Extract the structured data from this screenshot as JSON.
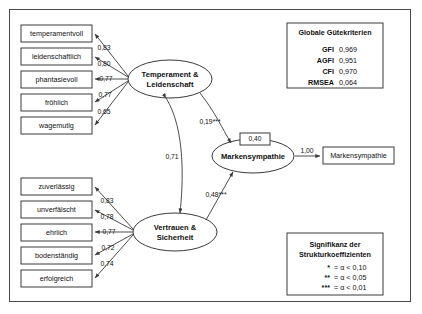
{
  "diagram": {
    "title_visible": false,
    "constructs": [
      {
        "id": "temperament",
        "label_line1": "Temperament &",
        "label_line2": "Leidenschaft"
      },
      {
        "id": "vertrauen",
        "label_line1": "Vertrauen &",
        "label_line2": "Sicherheit"
      },
      {
        "id": "markensympathie",
        "label_line1": "Markensympathie",
        "label_line2": ""
      }
    ],
    "indicators_top": [
      {
        "label": "temperamentvoll",
        "loading": "0,83"
      },
      {
        "label": "leidenschaftlich",
        "loading": "0,80"
      },
      {
        "label": "phantasievoll",
        "loading": "0,77"
      },
      {
        "label": "fröhlich",
        "loading": "0,77"
      },
      {
        "label": "wagemutig",
        "loading": "0,65"
      }
    ],
    "indicators_bottom": [
      {
        "label": "zuverlässig",
        "loading": "0,83"
      },
      {
        "label": "unverfälscht",
        "loading": "0,78"
      },
      {
        "label": "ehrlich",
        "loading": "0,77"
      },
      {
        "label": "bodenständig",
        "loading": "0,72"
      },
      {
        "label": "erfolgreich",
        "loading": "0,74"
      }
    ],
    "outcome_indicator": {
      "label": "Markensympathie",
      "loading": "1,00"
    },
    "structural_paths": [
      {
        "from": "temperament",
        "to": "markensympathie",
        "coefficient": "0,19***"
      },
      {
        "from": "vertrauen",
        "to": "markensympathie",
        "coefficient": "0,48***"
      }
    ],
    "correlation": {
      "between": "temperament-vertrauen",
      "value": "0,71"
    },
    "r_squared": {
      "target": "markensympathie",
      "value": "0,40"
    }
  },
  "fit_box": {
    "title": "Globale Gütekriterien",
    "rows": [
      {
        "key": "GFI",
        "value": "0,969"
      },
      {
        "key": "AGFI",
        "value": "0,951"
      },
      {
        "key": "CFI",
        "value": "0,970"
      },
      {
        "key": "RMSEA",
        "value": "0,064"
      }
    ]
  },
  "significance_box": {
    "title_line1": "Signifikanz der",
    "title_line2": "Strukturkoeffizienten",
    "rows": [
      {
        "stars": "*",
        "definition": "= α < 0,10"
      },
      {
        "stars": "**",
        "definition": "= α < 0,05"
      },
      {
        "stars": "***",
        "definition": "= α < 0,01"
      }
    ]
  }
}
